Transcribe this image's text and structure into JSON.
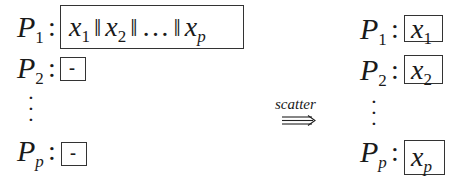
{
  "diagram": {
    "title": "",
    "arrow_label": "scatter",
    "before": {
      "processes": [
        {
          "name": "P",
          "sub": "1",
          "content": [
            "x",
            "1",
            "‖",
            "x",
            "2",
            "‖",
            "…",
            "‖",
            "x",
            "p"
          ],
          "label": "x1 || x2 || ... || xp"
        },
        {
          "name": "P",
          "sub": "2",
          "content": "-",
          "label": "-"
        },
        {
          "name": "P",
          "sub": "p",
          "content": "-",
          "label": "-"
        }
      ]
    },
    "after": {
      "processes": [
        {
          "name": "P",
          "sub": "1",
          "content_var": "x",
          "content_sub": "1"
        },
        {
          "name": "P",
          "sub": "2",
          "content_var": "x",
          "content_sub": "2"
        },
        {
          "name": "P",
          "sub": "p",
          "content_var": "x",
          "content_sub": "p"
        }
      ]
    },
    "colon": ":",
    "separator": "‖",
    "ellipsis": "…",
    "vdots": "⋮",
    "empty_marker": "-",
    "colors": {
      "stroke": "#333333",
      "text": "#1a1a1a",
      "background": "#ffffff"
    }
  }
}
